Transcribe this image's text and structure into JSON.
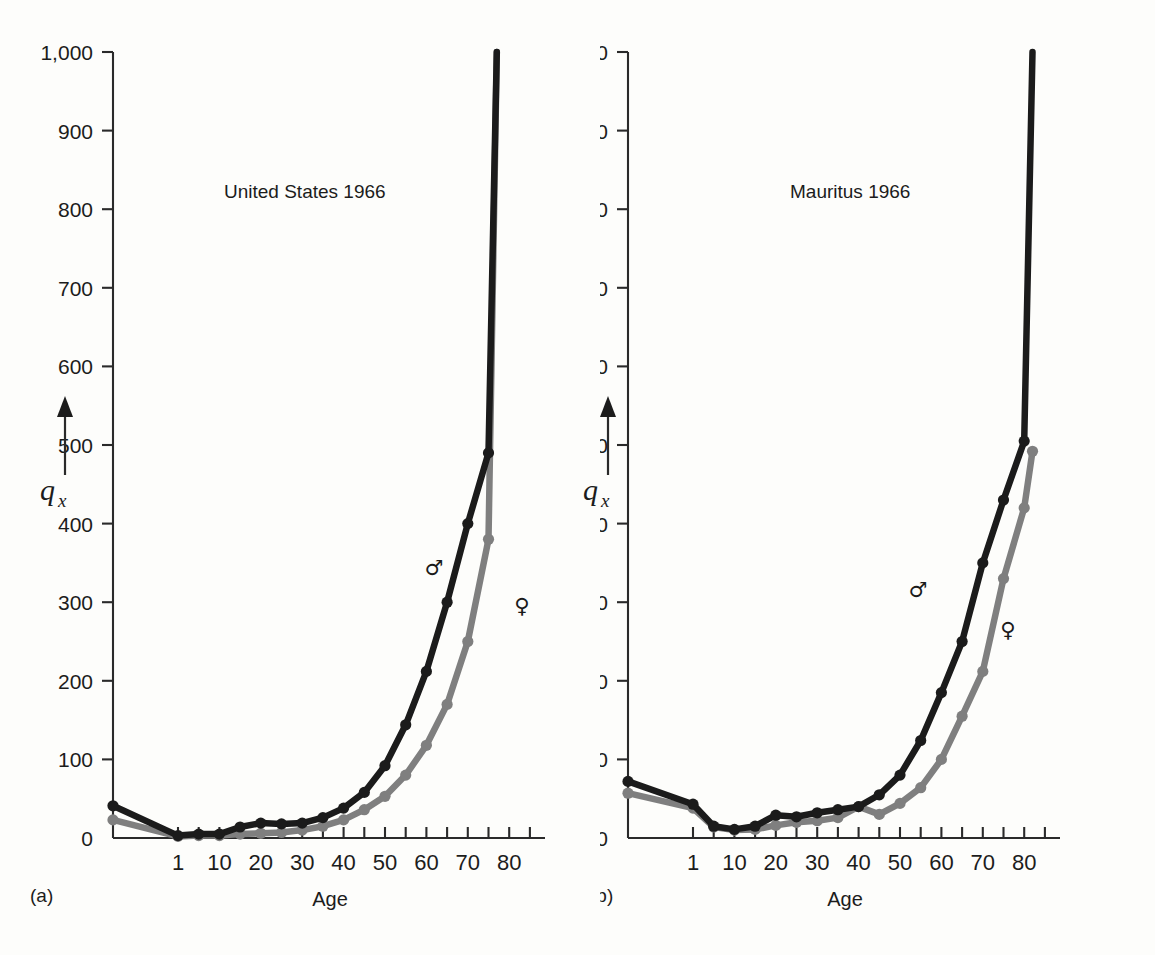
{
  "figure": {
    "y_axis_label": "q",
    "y_axis_sublabel": "x",
    "x_axis_label": "Age",
    "panel_a_tag": "(a)",
    "panel_b_tag": "(b)",
    "male_symbol": "♂",
    "female_symbol": "♀",
    "colors": {
      "male": "#1b1b1b",
      "female": "#7f7f7f",
      "axis": "#2a2a2a",
      "background": "#fdfdfb"
    }
  },
  "chart_data": [
    {
      "type": "line",
      "title": "United States 1966",
      "panel": "(a)",
      "xlabel": "Age",
      "ylabel": "qx",
      "xlim": [
        0,
        85
      ],
      "ylim": [
        0,
        1000
      ],
      "grid": false,
      "legend_position": "inline-annotation",
      "x_ticks_labeled": [
        1,
        10,
        20,
        30,
        40,
        50,
        60,
        70,
        80
      ],
      "x_ticks_minor_step": 5,
      "y_ticks": [
        0,
        100,
        200,
        300,
        400,
        500,
        600,
        700,
        800,
        900,
        1000
      ],
      "y_tick_labels": [
        "0",
        "100",
        "200",
        "300",
        "400",
        "500",
        "600",
        "700",
        "800",
        "900",
        "1,000"
      ],
      "x": [
        0,
        1,
        5,
        10,
        15,
        20,
        25,
        30,
        35,
        40,
        45,
        50,
        55,
        60,
        65,
        70,
        75,
        77
      ],
      "series": [
        {
          "name": "Male",
          "symbol": "♂",
          "color": "#1b1b1b",
          "values": [
            41,
            3,
            5,
            5,
            14,
            19,
            18,
            19,
            26,
            38,
            58,
            92,
            144,
            212,
            300,
            400,
            490,
            1000
          ]
        },
        {
          "name": "Female",
          "symbol": "♀",
          "color": "#7f7f7f",
          "values": [
            23,
            2,
            3,
            3,
            5,
            6,
            7,
            10,
            15,
            23,
            36,
            53,
            80,
            118,
            170,
            250,
            380,
            1000
          ]
        }
      ]
    },
    {
      "type": "line",
      "title": "Mauritus 1966",
      "panel": "(b)",
      "xlabel": "Age",
      "ylabel": "qx",
      "xlim": [
        0,
        85
      ],
      "ylim": [
        0,
        1000
      ],
      "grid": false,
      "legend_position": "inline-annotation",
      "x_ticks_labeled": [
        1,
        10,
        20,
        30,
        40,
        50,
        60,
        70,
        80
      ],
      "x_ticks_minor_step": 5,
      "y_ticks": [
        0,
        100,
        200,
        300,
        400,
        500,
        600,
        700,
        800,
        900,
        1000
      ],
      "y_tick_labels": [
        "0",
        "100",
        "200",
        "300",
        "400",
        "500",
        "600",
        "700",
        "800",
        "900",
        "1,000"
      ],
      "x": [
        0,
        1,
        5,
        10,
        15,
        20,
        25,
        30,
        35,
        40,
        45,
        50,
        55,
        60,
        65,
        70,
        75,
        80,
        82
      ],
      "series": [
        {
          "name": "Male",
          "symbol": "♂",
          "color": "#1b1b1b",
          "values": [
            72,
            43,
            15,
            11,
            15,
            29,
            27,
            32,
            36,
            40,
            55,
            80,
            124,
            185,
            250,
            350,
            430,
            505,
            1000
          ]
        },
        {
          "name": "Female",
          "symbol": "♀",
          "color": "#7f7f7f",
          "values": [
            57,
            38,
            14,
            10,
            11,
            16,
            20,
            22,
            26,
            40,
            30,
            44,
            64,
            100,
            155,
            212,
            330,
            420,
            492
          ]
        }
      ]
    }
  ]
}
